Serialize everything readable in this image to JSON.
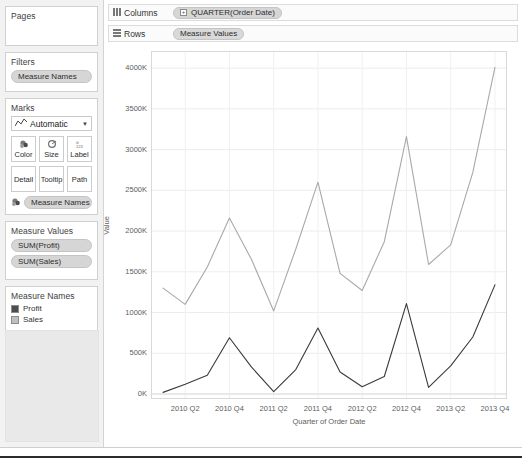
{
  "sidebar": {
    "pages": {
      "title": "Pages"
    },
    "filters": {
      "title": "Filters",
      "fields": [
        "Measure Names"
      ]
    },
    "marks": {
      "title": "Marks",
      "mark_type": "Automatic",
      "mark_type_icon": "line-chart-icon",
      "caret_icon": "chevron-down-icon",
      "buttons": [
        {
          "label": "Color",
          "icon": "color-palette-icon"
        },
        {
          "label": "Size",
          "icon": "size-circle-icon"
        },
        {
          "label": "Label",
          "icon": "label-text-icon"
        },
        {
          "label": "Detail",
          "icon": ""
        },
        {
          "label": "Tooltip",
          "icon": ""
        },
        {
          "label": "Path",
          "icon": ""
        }
      ],
      "fields": [
        {
          "label": "Measure Names",
          "icon": "color-palette-icon"
        }
      ]
    },
    "measure_values": {
      "title": "Measure Values",
      "fields": [
        "SUM(Profit)",
        "SUM(Sales)"
      ]
    },
    "legend": {
      "title": "Measure Names",
      "items": [
        {
          "label": "Profit",
          "color": "#4d4d4d"
        },
        {
          "label": "Sales",
          "color": "#bfbfbf"
        }
      ]
    }
  },
  "shelves": {
    "columns": {
      "label": "Columns",
      "icon": "columns-grid-icon",
      "fields": [
        {
          "label": "QUARTER(Order Date)",
          "plus": "+"
        }
      ]
    },
    "rows": {
      "label": "Rows",
      "icon": "rows-grid-icon",
      "fields": [
        {
          "label": "Measure Values",
          "plus": ""
        }
      ]
    }
  },
  "chart_data": {
    "type": "line",
    "title": "",
    "xlabel": "Quarter of Order Date",
    "ylabel": "Value",
    "grid": true,
    "legend_position": "left-sidebar",
    "ylim": [
      0,
      4100
    ],
    "ytick_labels": [
      "0K",
      "500K",
      "1000K",
      "1500K",
      "2000K",
      "2500K",
      "3000K",
      "3500K",
      "4000K"
    ],
    "ytick_values": [
      0,
      500,
      1000,
      1500,
      2000,
      2500,
      3000,
      3500,
      4000
    ],
    "xtick_labels": [
      "2010 Q2",
      "2010 Q4",
      "2011 Q2",
      "2011 Q4",
      "2012 Q2",
      "2012 Q4",
      "2013 Q2",
      "2013 Q4"
    ],
    "x": [
      "2010 Q1",
      "2010 Q2",
      "2010 Q3",
      "2010 Q4",
      "2011 Q1",
      "2011 Q2",
      "2011 Q3",
      "2011 Q4",
      "2012 Q1",
      "2012 Q2",
      "2012 Q3",
      "2012 Q4",
      "2013 Q1",
      "2013 Q2",
      "2013 Q3",
      "2013 Q4"
    ],
    "series": [
      {
        "name": "Sales",
        "color": "#a9a9a9",
        "values": [
          1300,
          1100,
          1560,
          2160,
          1650,
          1020,
          1780,
          2600,
          1480,
          1270,
          1870,
          3160,
          1590,
          1830,
          2720,
          4010
        ]
      },
      {
        "name": "Profit",
        "color": "#3a3a3a",
        "values": [
          20,
          120,
          230,
          690,
          330,
          30,
          300,
          810,
          270,
          90,
          215,
          1110,
          80,
          345,
          700,
          1340
        ]
      }
    ]
  }
}
